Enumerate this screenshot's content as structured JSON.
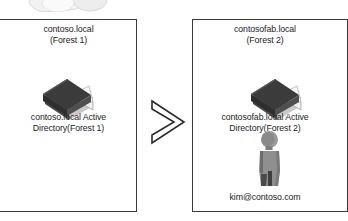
{
  "diagram": {
    "title_hidden": "",
    "cloud": {
      "icon": "cloud-icon"
    },
    "arrow": {
      "icon": "chevron-right-icon",
      "label": ""
    },
    "left_forest": {
      "header": "contoso.local\n(Forest 1)",
      "directory_icon": "book-icon",
      "directory_label": "contoso.local Active\nDirectory(Forest 1)"
    },
    "right_forest": {
      "header": "contosofab.local\n(Forest 2)",
      "directory_icon": "book-icon",
      "directory_label": "contosofab.local Active\nDirectory(Forest 2)",
      "user_icon": "user-icon",
      "user_label": "kim@contoso.com"
    }
  },
  "colors": {
    "box_border": "#3a3a3a",
    "text": "#1d1d1d",
    "book_cover_dark": "#3b3b3b",
    "book_cover_mid": "#555555",
    "book_pages": "#e8e8e8",
    "person_body": "#8c8c8c",
    "person_shadow": "#474747",
    "cloud_fill": "#efefef",
    "background": "#ffffff"
  }
}
